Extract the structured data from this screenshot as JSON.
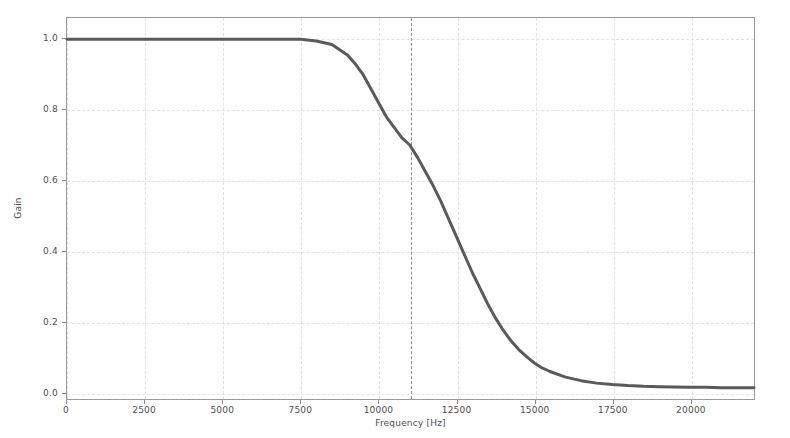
{
  "chart_data": {
    "type": "line",
    "title": "",
    "xlabel": "Frequency [Hz]",
    "ylabel": "Gain",
    "xlim": [
      0,
      22050
    ],
    "ylim": [
      -0.02,
      1.06
    ],
    "grid": true,
    "legend": null,
    "xticks": [
      0,
      2500,
      5000,
      7500,
      10000,
      12500,
      15000,
      17500,
      20000
    ],
    "xticklabels": [
      "0",
      "2500",
      "5000",
      "7500",
      "10000",
      "12500",
      "15000",
      "17500",
      "20000"
    ],
    "yticks": [
      0.0,
      0.2,
      0.4,
      0.6,
      0.8,
      1.0
    ],
    "yticklabels": [
      "0.0",
      "0.2",
      "0.4",
      "0.6",
      "0.8",
      "1.0"
    ],
    "annotations": [
      {
        "name": "cutoff-frequency-line",
        "style": "dashed-vertical",
        "x": 11000,
        "color": "#8d8d8d"
      }
    ],
    "series": [
      {
        "name": "gain-response",
        "color": "#5a5a5a",
        "linewidth": 3,
        "x": [
          0,
          500,
          1000,
          1500,
          2000,
          2500,
          3000,
          3500,
          4000,
          4500,
          5000,
          5500,
          6000,
          6500,
          7000,
          7500,
          8000,
          8500,
          9000,
          9250,
          9500,
          9750,
          10000,
          10250,
          10500,
          10750,
          11000,
          11250,
          11500,
          11750,
          12000,
          12250,
          12500,
          12750,
          13000,
          13250,
          13500,
          13750,
          14000,
          14250,
          14500,
          14750,
          15000,
          15250,
          15500,
          16000,
          16500,
          17000,
          17500,
          18000,
          18500,
          19000,
          19500,
          20000,
          20500,
          21000,
          21500,
          22050
        ],
        "y": [
          1.0,
          1.0,
          1.0,
          1.0,
          1.0,
          1.0,
          1.0,
          1.0,
          1.0,
          1.0,
          1.0,
          1.0,
          1.0,
          1.0,
          1.0,
          1.0,
          0.995,
          0.985,
          0.955,
          0.93,
          0.9,
          0.86,
          0.82,
          0.78,
          0.75,
          0.72,
          0.7,
          0.665,
          0.625,
          0.585,
          0.54,
          0.49,
          0.44,
          0.39,
          0.34,
          0.295,
          0.25,
          0.21,
          0.175,
          0.145,
          0.12,
          0.1,
          0.082,
          0.068,
          0.058,
          0.042,
          0.032,
          0.025,
          0.021,
          0.018,
          0.016,
          0.015,
          0.014,
          0.013,
          0.013,
          0.012,
          0.012,
          0.012
        ]
      }
    ]
  }
}
